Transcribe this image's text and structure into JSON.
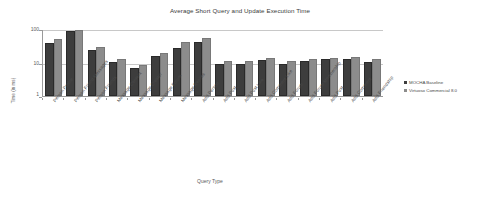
{
  "chart_data": {
    "type": "bar",
    "title": "Average Short Query and Update Execution Time",
    "xlabel": "Query Type",
    "ylabel": "Time (in ms)",
    "yscale": "log",
    "ylim": [
      1,
      100
    ],
    "yticks": [
      "1",
      "10",
      "100"
    ],
    "grid": true,
    "legend_position": "right",
    "categories": [
      "Person Profile",
      "Person Friend Messages",
      "Person Friends",
      "Message Content",
      "Message Creator",
      "Message Forum",
      "Message Replies",
      "Add Person",
      "Add Post",
      "Add Post Like",
      "Add Comment Like",
      "Add Forum",
      "Add Forum Membership",
      "Add Post",
      "Add Comment",
      "Add Friendship"
    ],
    "series": [
      {
        "name": "MOCHA Baseline",
        "color": "#3d3d3d",
        "values": [
          33,
          78,
          21,
          9.2,
          6.1,
          14,
          24,
          35,
          8.0,
          7.9,
          10.2,
          7.8,
          9.8,
          10.8,
          11.2,
          8.9
        ]
      },
      {
        "name": "Virtuoso Commercial 8.0",
        "color": "#8c8c8c",
        "values": [
          45,
          80,
          26,
          11.2,
          7.6,
          17,
          35,
          48,
          9.9,
          9.5,
          11.6,
          9.6,
          11.4,
          12.3,
          12.6,
          10.9
        ]
      }
    ]
  },
  "legend": {
    "items": [
      {
        "label": "MOCHA Baseline"
      },
      {
        "label": "Virtuoso Commercial 8.0"
      }
    ]
  }
}
